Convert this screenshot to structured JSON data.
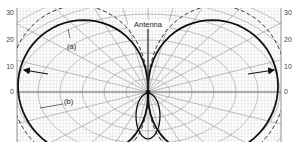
{
  "figure": {
    "title_label": "Antenna",
    "curve_labels": {
      "a": "(a)",
      "b": "(b)"
    },
    "left_axis_ticks": [
      "30",
      "20",
      "10",
      "0"
    ],
    "right_axis_ticks": [
      "30",
      "20",
      "10",
      "0"
    ],
    "colors": {
      "grid_fine": "#c8c8c8",
      "grid_major": "#8a8a8a",
      "curve": "#111111",
      "background": "#ffffff"
    }
  },
  "chart_data": {
    "type": "polar-radiation-pattern",
    "title": "Antenna",
    "axis_tick_labels": [
      30,
      20,
      10,
      0
    ],
    "series": [
      {
        "name": "(a)",
        "style": "dashed",
        "description": "two-lobe pattern, slightly larger, dashed"
      },
      {
        "name": "(b)",
        "style": "solid",
        "description": "two-lobe figure-eight pattern with small rear lobe, solid"
      }
    ]
  }
}
